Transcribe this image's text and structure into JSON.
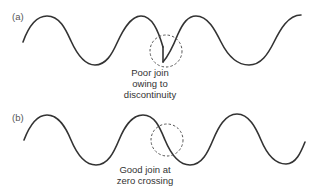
{
  "panels": [
    {
      "id": "a",
      "label": "(a)",
      "caption_lines": [
        "Poor join",
        "owing to",
        "discontinuity"
      ],
      "join_type": "discontinuity"
    },
    {
      "id": "b",
      "label": "(b)",
      "caption_lines": [
        "Good join at",
        "zero crossing"
      ],
      "join_type": "zero-crossing"
    }
  ],
  "colors": {
    "wave": "#333333",
    "circle": "#555555",
    "text": "#333333",
    "label": "#555555",
    "background": "#ffffff"
  }
}
